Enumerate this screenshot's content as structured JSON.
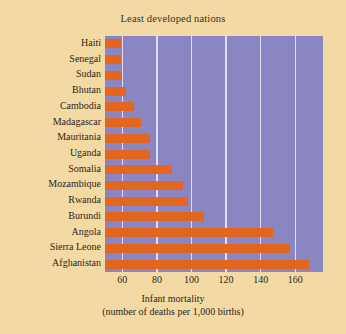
{
  "figure": {
    "background_color": "#f3daa4",
    "plot_background_color": "#8a86c4",
    "bar_color": "#e2661f",
    "gridline_color": "#e9e6f3"
  },
  "chart_data": {
    "type": "bar",
    "orientation": "horizontal",
    "title": "Least developed nations",
    "xlabel_line1": "Infant mortality",
    "xlabel_line2": "(number of deaths per 1,000 births)",
    "ylabel": "",
    "categories": [
      "Haiti",
      "Senegal",
      "Sudan",
      "Bhutan",
      "Cambodia",
      "Madagascar",
      "Mauritania",
      "Uganda",
      "Somalia",
      "Mozambique",
      "Rwanda",
      "Burundi",
      "Angola",
      "Sierra Leone",
      "Afghanistan"
    ],
    "values": [
      59,
      59,
      60,
      62,
      67,
      71,
      76,
      76,
      89,
      95,
      98,
      107,
      147,
      157,
      168
    ],
    "xlim": [
      50,
      176
    ],
    "xticks": [
      60,
      80,
      100,
      120,
      140,
      160
    ],
    "xtick_labels": [
      "60",
      "80",
      "100",
      "120",
      "140",
      "160"
    ],
    "grid": "vertical",
    "legend": "none"
  }
}
